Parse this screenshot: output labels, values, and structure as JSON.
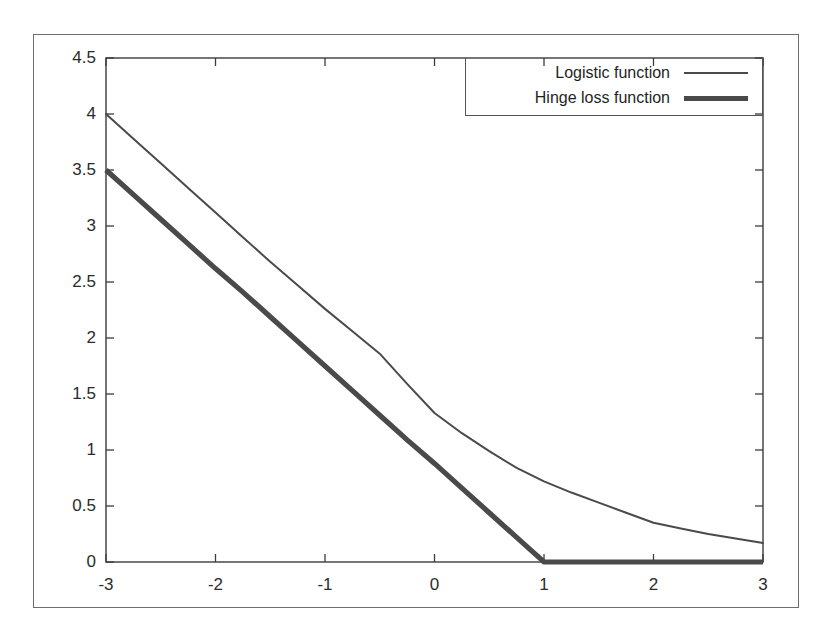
{
  "figure": {
    "caption_remnant": "",
    "background_color": "#ffffff",
    "frame_color": "#6e6e6e",
    "line_color": "#4a4a4a"
  },
  "legend": {
    "position": "top-right",
    "entries": [
      {
        "label": "Logistic function",
        "style": "thin-line",
        "swatch": "line-thin-icon"
      },
      {
        "label": "Hinge loss function",
        "style": "thick-line",
        "swatch": "line-thick-icon"
      }
    ]
  },
  "axes": {
    "x": {
      "label": "",
      "min": -3,
      "max": 3,
      "tick_values": [
        -3,
        -2,
        -1,
        0,
        1,
        2,
        3
      ],
      "tick_labels": [
        "-3",
        "-2",
        "-1",
        "0",
        "1",
        "2",
        "3"
      ]
    },
    "y": {
      "label": "",
      "min": 0,
      "max": 4.5,
      "tick_values": [
        0,
        0.5,
        1,
        1.5,
        2,
        2.5,
        3,
        3.5,
        4,
        4.5
      ],
      "tick_labels": [
        "0",
        "0.5",
        "1",
        "1.5",
        "2",
        "2.5",
        "3",
        "3.5",
        "4",
        "4.5"
      ]
    },
    "grid": false
  },
  "chart_data": {
    "type": "line",
    "title": "",
    "xlabel": "",
    "ylabel": "",
    "xlim": [
      -3,
      3
    ],
    "ylim": [
      0,
      4.5
    ],
    "grid": false,
    "legend_position": "top-right",
    "x": [
      -3,
      -2.75,
      -2.5,
      -2.25,
      -2,
      -1.75,
      -1.5,
      -1.25,
      -1,
      -0.75,
      -0.5,
      -0.25,
      0,
      0.25,
      0.5,
      0.75,
      1,
      1.25,
      1.5,
      1.75,
      2,
      2.25,
      2.5,
      2.75,
      3
    ],
    "series": [
      {
        "name": "Logistic function",
        "style": "thin-line",
        "color": "#4a4a4a",
        "values": [
          4.0,
          3.78,
          3.56,
          3.34,
          3.12,
          2.9,
          2.68,
          2.47,
          2.26,
          2.06,
          1.86,
          1.59,
          1.33,
          1.15,
          0.99,
          0.84,
          0.72,
          0.62,
          0.53,
          0.44,
          0.35,
          0.3,
          0.25,
          0.21,
          0.17
        ]
      },
      {
        "name": "Hinge loss function",
        "style": "thick-line",
        "color": "#4a4a4a",
        "values": [
          3.5,
          3.28,
          3.06,
          2.84,
          2.62,
          2.41,
          2.19,
          1.97,
          1.75,
          1.53,
          1.31,
          1.09,
          0.88,
          0.66,
          0.44,
          0.22,
          0.0,
          0.0,
          0.0,
          0.0,
          0.0,
          0.0,
          0.0,
          0.0,
          0.0
        ]
      }
    ],
    "annotations": [
      "Hinge loss reaches zero at x = 1 and remains flat thereafter.",
      "Logistic function decays smoothly toward zero but stays positive."
    ]
  }
}
